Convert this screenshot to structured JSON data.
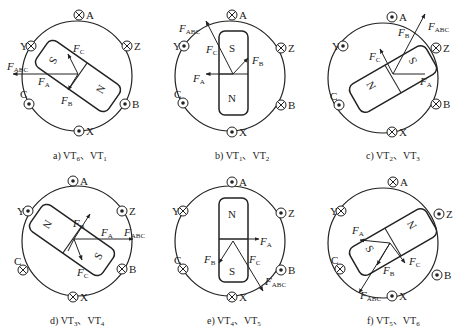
{
  "figure": {
    "type": "BLDC motor rotor/stator MMF vector diagrams",
    "symbols": {
      "dot": "current out of page (⊙)",
      "cross": "current into page (⊗)"
    },
    "panels": [
      {
        "id": "a",
        "caption": "a) VT6、VT1",
        "caption_prefix": "a) VT",
        "sub1": "6",
        "sep": "、VT",
        "sub2": "1",
        "coils": {
          "A": "cross",
          "Y": "cross",
          "Z": "cross",
          "C": "dot",
          "B": "dot",
          "X": "dot"
        },
        "vectors": [
          "FA",
          "FB",
          "FC",
          "FABC"
        ],
        "rotor_angle_deg": 35,
        "rotor_pole_upper": "S",
        "rotor_pole_lower": "N"
      },
      {
        "id": "b",
        "caption": "b) VT1、VT2",
        "caption_prefix": "b) VT",
        "sub1": "1",
        "sep": "、VT",
        "sub2": "2",
        "coils": {
          "A": "cross",
          "Y": "dot",
          "Z": "cross",
          "C": "dot",
          "B": "cross",
          "X": "dot"
        },
        "vectors": [
          "FA",
          "FB",
          "FC",
          "FABC"
        ],
        "rotor_angle_deg": 90,
        "rotor_pole_upper": "S",
        "rotor_pole_lower": "N"
      },
      {
        "id": "c",
        "caption": "c) VT2、VT3",
        "caption_prefix": "c) VT",
        "sub1": "2",
        "sep": "、VT",
        "sub2": "3",
        "coils": {
          "A": "dot",
          "Y": "dot",
          "Z": "cross",
          "C": "dot",
          "B": "cross",
          "X": "cross"
        },
        "vectors": [
          "FA",
          "FB",
          "FC",
          "FABC"
        ],
        "rotor_angle_deg": -30,
        "rotor_pole_upper": "S",
        "rotor_pole_lower": "N"
      },
      {
        "id": "d",
        "caption": "d) VT3、VT4",
        "caption_prefix": "d) VT",
        "sub1": "3",
        "sep": "、VT",
        "sub2": "4",
        "coils": {
          "A": "dot",
          "Y": "dot",
          "Z": "dot",
          "C": "cross",
          "B": "cross",
          "X": "cross"
        },
        "vectors": [
          "FA",
          "FB",
          "FC",
          "FABC"
        ],
        "rotor_angle_deg": 35,
        "rotor_pole_upper": "N",
        "rotor_pole_lower": "S"
      },
      {
        "id": "e",
        "caption": "e) VT4、VT5",
        "caption_prefix": "e) VT",
        "sub1": "4",
        "sep": "、VT",
        "sub2": "5",
        "coils": {
          "A": "dot",
          "Y": "cross",
          "Z": "dot",
          "C": "cross",
          "B": "dot",
          "X": "cross"
        },
        "vectors": [
          "FA",
          "FB",
          "FC",
          "FABC"
        ],
        "rotor_angle_deg": 90,
        "rotor_pole_upper": "N",
        "rotor_pole_lower": "S"
      },
      {
        "id": "f",
        "caption": "f) VT5、VT6",
        "caption_prefix": "f) VT",
        "sub1": "5",
        "sep": "、VT",
        "sub2": "6",
        "coils": {
          "A": "cross",
          "Y": "cross",
          "Z": "dot",
          "C": "cross",
          "B": "dot",
          "X": "dot"
        },
        "vectors": [
          "FA",
          "FB",
          "FC",
          "FABC"
        ],
        "rotor_angle_deg": -30,
        "rotor_pole_upper": "N",
        "rotor_pole_lower": "S"
      }
    ],
    "labels": {
      "A": "A",
      "B": "B",
      "C": "C",
      "X": "X",
      "Y": "Y",
      "Z": "Z",
      "F": "F",
      "sub_A": "A",
      "sub_B": "B",
      "sub_C": "C",
      "sub_ABC": "ABC",
      "N": "N",
      "S": "S"
    }
  }
}
